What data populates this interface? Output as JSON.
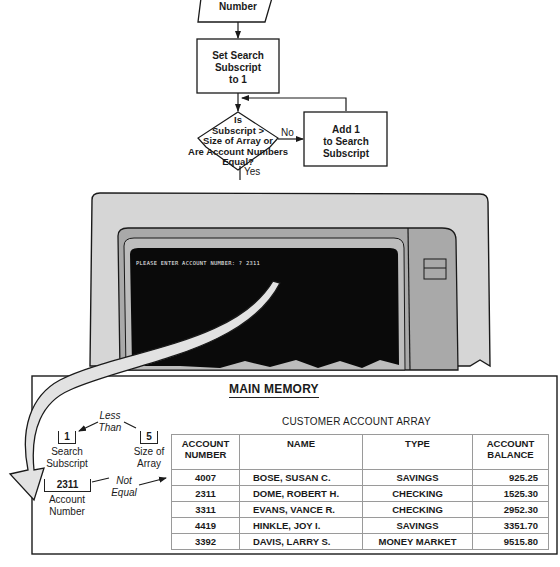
{
  "flowchart": {
    "input_step": "Number",
    "set_step": [
      "Set Search",
      "Subscript",
      "to 1"
    ],
    "decision": [
      "Is",
      "Subscript >",
      "Size of Array or",
      "Are Account Numbers",
      "Equal?"
    ],
    "no_label": "No",
    "yes_label": "Yes",
    "add_step": [
      "Add 1",
      "to Search",
      "Subscript"
    ]
  },
  "terminal": {
    "prompt": "PLEASE ENTER ACCOUNT NUMBER: ? 2311"
  },
  "memory": {
    "title": "MAIN MEMORY",
    "search_subscript": {
      "value": "1",
      "label": [
        "Search",
        "Subscript"
      ]
    },
    "size_of_array": {
      "value": "5",
      "label": [
        "Size of",
        "Array"
      ]
    },
    "account_number": {
      "value": "2311",
      "label": [
        "Account",
        "Number"
      ]
    },
    "less_than_label": [
      "Less",
      "Than"
    ],
    "not_equal_label": [
      "Not",
      "Equal"
    ],
    "array": {
      "title": "CUSTOMER ACCOUNT ARRAY",
      "columns": [
        [
          "ACCOUNT",
          "NUMBER"
        ],
        [
          "NAME"
        ],
        [
          "TYPE"
        ],
        [
          "ACCOUNT",
          "BALANCE"
        ]
      ],
      "rows": [
        [
          "4007",
          "BOSE, SUSAN C.",
          "SAVINGS",
          "925.25"
        ],
        [
          "2311",
          "DOME, ROBERT H.",
          "CHECKING",
          "1525.30"
        ],
        [
          "3311",
          "EVANS, VANCE R.",
          "CHECKING",
          "2952.30"
        ],
        [
          "4419",
          "HINKLE, JOY I.",
          "SAVINGS",
          "3351.70"
        ],
        [
          "3392",
          "DAVIS, LARRY S.",
          "MONEY MARKET",
          "9515.80"
        ]
      ]
    }
  },
  "colors": {
    "line": "#1a1a1a",
    "bezel_light": "#d6d6d6",
    "bezel_mid": "#a9a9a9",
    "screen": "#0a0a0a",
    "arrow_fill": "#e2e2e2"
  }
}
